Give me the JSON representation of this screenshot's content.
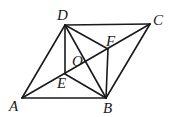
{
  "diagram": {
    "type": "geometry",
    "points": {
      "A": {
        "label": "A",
        "x": 22,
        "y": 98
      },
      "B": {
        "label": "B",
        "x": 106,
        "y": 98
      },
      "C": {
        "label": "C",
        "x": 150,
        "y": 24
      },
      "D": {
        "label": "D",
        "x": 65,
        "y": 25
      },
      "E": {
        "label": "E",
        "x": 65,
        "y": 74
      },
      "F": {
        "label": "F",
        "x": 108,
        "y": 49
      },
      "O": {
        "label": "O",
        "x": 86,
        "y": 61
      }
    },
    "segments": [
      "AB",
      "BC",
      "CD",
      "DA",
      "AC",
      "BD",
      "DE",
      "DF",
      "BE",
      "BF"
    ]
  }
}
